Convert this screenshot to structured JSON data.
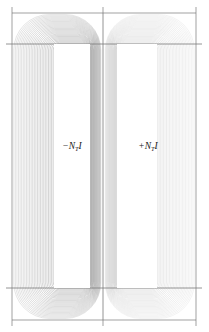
{
  "figure": {
    "title": "",
    "background_color": "#ffffff",
    "line_color": "#8a8a8a",
    "frame_color": "#7a7a7a",
    "label_color": "#1a1a1a"
  },
  "labels": {
    "left_coil": "−N",
    "left_coil_sub": "T",
    "left_coil_tail": "I",
    "right_coil": "+N",
    "right_coil_sub": "T",
    "right_coil_tail": "I",
    "left_coil_full": "−N_T I",
    "right_coil_full": "+N_T I"
  },
  "chart_data": {
    "type": "contour",
    "title": "",
    "xlabel": "",
    "ylabel": "",
    "regions": [
      {
        "name": "left-coil-window",
        "current_label": "−N_T I",
        "polarity": "negative",
        "x": 54,
        "y": 44,
        "width": 36,
        "height": 244,
        "contour_count": 26,
        "line_weight": "heavy"
      },
      {
        "name": "right-coil-window",
        "current_label": "+N_T I",
        "polarity": "positive",
        "x": 117,
        "y": 44,
        "width": 40,
        "height": 244,
        "contour_count": 26,
        "line_weight": "light"
      }
    ],
    "frame": {
      "outer": {
        "x": 12,
        "y": 13,
        "width": 184,
        "height": 307
      },
      "center_divider_x": 103,
      "horizontal_rule_top_y": 44,
      "horizontal_rule_bottom_y": 288,
      "tick_positions_x": [
        12,
        103,
        196
      ],
      "tick_length": 6
    },
    "axis_ranges": {
      "xlim": [
        0,
        209
      ],
      "ylim": [
        0,
        332
      ]
    },
    "grid": false,
    "legend": "none"
  }
}
